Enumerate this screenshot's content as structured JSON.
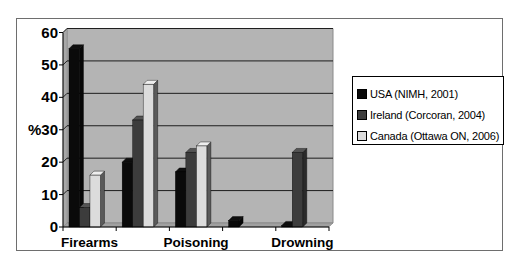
{
  "chart_data": {
    "type": "bar",
    "style": "3d-clustered-column",
    "title": "",
    "xlabel": "",
    "ylabel": "%",
    "ylim": [
      0,
      60
    ],
    "yticks": [
      0,
      10,
      20,
      30,
      40,
      50,
      60
    ],
    "grid": true,
    "legend_position": "right",
    "categories": [
      "Firearms",
      "",
      "Poisoning",
      "",
      "Drowning"
    ],
    "visible_category_labels": [
      "Firearms",
      "Poisoning",
      "Drowning"
    ],
    "series": [
      {
        "name": "USA (NIMH, 2001)",
        "color": "#0a0a0a",
        "values": [
          55,
          20,
          17,
          2,
          0.5
        ]
      },
      {
        "name": "Ireland (Corcoran, 2004)",
        "color": "#3c3c3c",
        "values": [
          6,
          33,
          23,
          0,
          23
        ]
      },
      {
        "name": "Canada (Ottawa ON, 2006)",
        "color": "#dcdcdc",
        "values": [
          16,
          44,
          25,
          0,
          0
        ]
      }
    ]
  },
  "colors": {
    "wall": "#b4b4b4",
    "floor": "#a0a0a0",
    "gridline": "#1e1e1e",
    "frame": "#6e6e6e"
  },
  "legend": {
    "items": [
      {
        "label": "USA (NIMH, 2001)",
        "color": "#0a0a0a"
      },
      {
        "label": "Ireland (Corcoran, 2004)",
        "color": "#3c3c3c"
      },
      {
        "label": "Canada (Ottawa ON, 2006)",
        "color": "#dcdcdc"
      }
    ]
  }
}
